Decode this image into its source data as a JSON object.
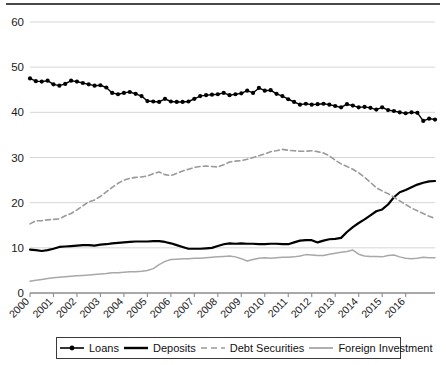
{
  "chart_data": {
    "type": "line",
    "title": "",
    "subtitle": "",
    "xlabel": "",
    "ylabel": "",
    "ylim": [
      0,
      60
    ],
    "yticks": [
      0,
      10,
      20,
      30,
      40,
      50,
      60
    ],
    "grid": true,
    "legend_position": "bottom",
    "x_tick_labels": [
      "2000",
      "2001",
      "2002",
      "2003",
      "2004",
      "2005",
      "2006",
      "2007",
      "2008",
      "2009",
      "2010",
      "2011",
      "2012",
      "2013",
      "2014",
      "2015",
      "2016"
    ],
    "x_start": 2000,
    "x_end": 2016.75,
    "x_step": 0.25,
    "series": [
      {
        "name": "Loans",
        "style": "solid-marker",
        "color": "#000000",
        "marker": "circle",
        "values": [
          47.5,
          46.9,
          46.8,
          47.0,
          46.2,
          45.9,
          46.3,
          47.0,
          46.8,
          46.5,
          46.2,
          45.9,
          46.0,
          45.5,
          44.3,
          44.0,
          44.3,
          44.5,
          44.1,
          43.6,
          42.5,
          42.4,
          42.3,
          43.0,
          42.4,
          42.3,
          42.3,
          42.4,
          43.0,
          43.6,
          43.8,
          43.9,
          44.0,
          44.3,
          43.8,
          44.0,
          44.2,
          44.8,
          44.3,
          45.4,
          44.8,
          44.9,
          44.1,
          43.6,
          42.9,
          42.3,
          41.7,
          41.9,
          41.7,
          41.8,
          41.9,
          41.7,
          41.4,
          41.1,
          41.8,
          41.5,
          41.1,
          41.2,
          41.0,
          40.6,
          41.1,
          40.5,
          40.3,
          40.0,
          39.8,
          40.0,
          39.9,
          38.1,
          38.6,
          38.4
        ]
      },
      {
        "name": "Deposits",
        "style": "solid-thick",
        "color": "#000000",
        "values": [
          9.6,
          9.5,
          9.3,
          9.5,
          9.8,
          10.2,
          10.3,
          10.4,
          10.5,
          10.6,
          10.6,
          10.5,
          10.7,
          10.8,
          11.0,
          11.1,
          11.2,
          11.3,
          11.4,
          11.4,
          11.4,
          11.5,
          11.5,
          11.3,
          11.0,
          10.6,
          10.2,
          9.8,
          9.8,
          9.8,
          9.9,
          10.0,
          10.4,
          10.8,
          11.0,
          10.9,
          11.0,
          10.9,
          10.9,
          10.8,
          10.8,
          10.9,
          10.9,
          10.8,
          10.8,
          11.2,
          11.6,
          11.7,
          11.7,
          11.2,
          11.6,
          11.9,
          12.0,
          12.2,
          13.5,
          14.6,
          15.5,
          16.3,
          17.2,
          18.1,
          18.5,
          19.6,
          21.2,
          22.3,
          22.8,
          23.4,
          24.0,
          24.4,
          24.7,
          24.8
        ]
      },
      {
        "name": "Debt Securities",
        "style": "dashed",
        "color": "#9a9a9a",
        "values": [
          15.3,
          16.0,
          16.0,
          16.2,
          16.3,
          16.4,
          17.1,
          17.6,
          18.4,
          19.3,
          20.2,
          20.6,
          21.4,
          22.4,
          23.4,
          24.3,
          25.0,
          25.4,
          25.6,
          25.7,
          25.9,
          26.4,
          26.8,
          26.2,
          26.0,
          26.5,
          27.0,
          27.4,
          27.8,
          28.0,
          28.1,
          28.0,
          27.9,
          28.4,
          29.0,
          29.2,
          29.3,
          29.6,
          30.0,
          30.4,
          30.8,
          31.3,
          31.5,
          31.8,
          31.6,
          31.5,
          31.4,
          31.4,
          31.5,
          31.3,
          31.0,
          30.4,
          29.4,
          28.6,
          28.0,
          27.4,
          26.6,
          25.6,
          24.5,
          23.3,
          22.6,
          22.0,
          21.2,
          20.4,
          19.6,
          18.8,
          18.2,
          17.6,
          17.0,
          16.5
        ]
      },
      {
        "name": "Foreign Investment",
        "style": "solid-light",
        "color": "#a8a8a8",
        "values": [
          2.6,
          2.8,
          3.0,
          3.2,
          3.4,
          3.5,
          3.6,
          3.7,
          3.8,
          3.9,
          4.0,
          4.1,
          4.2,
          4.3,
          4.5,
          4.5,
          4.6,
          4.7,
          4.7,
          4.8,
          5.0,
          5.4,
          6.3,
          7.0,
          7.4,
          7.5,
          7.6,
          7.6,
          7.7,
          7.7,
          7.8,
          7.9,
          8.0,
          8.1,
          8.2,
          8.0,
          7.6,
          7.1,
          7.4,
          7.7,
          7.8,
          7.7,
          7.8,
          7.9,
          7.9,
          8.0,
          8.2,
          8.5,
          8.4,
          8.3,
          8.3,
          8.6,
          8.8,
          9.0,
          9.2,
          9.5,
          8.6,
          8.2,
          8.1,
          8.1,
          8.0,
          8.3,
          8.4,
          8.0,
          7.7,
          7.6,
          7.7,
          7.9,
          7.8,
          7.8
        ]
      }
    ]
  },
  "legend": {
    "items": [
      {
        "label": "Loans",
        "icon": "line-with-marker-icon"
      },
      {
        "label": "Deposits",
        "icon": "solid-line-icon"
      },
      {
        "label": "Debt Securities",
        "icon": "dashed-line-icon"
      },
      {
        "label": "Foreign Investment",
        "icon": "light-line-icon"
      }
    ]
  },
  "colors": {
    "loans": "#000000",
    "deposits": "#000000",
    "debt_securities": "#9a9a9a",
    "foreign_investment": "#a8a8a8",
    "gridline": "#d6d6d6",
    "axis": "#8c8c8c",
    "rule": "#4a4a4a"
  }
}
